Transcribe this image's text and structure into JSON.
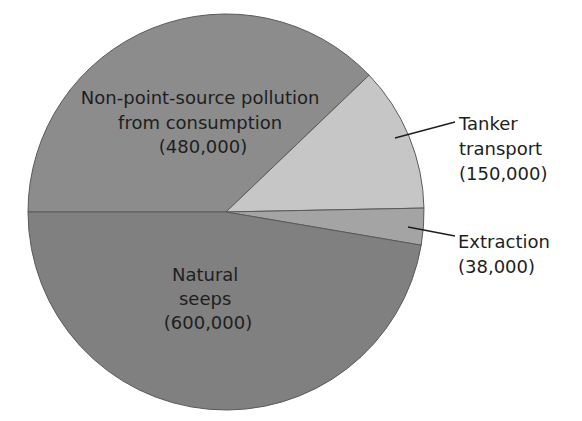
{
  "chart_data": {
    "type": "pie",
    "title": "",
    "unit_note": "",
    "slices": [
      {
        "name": "Non-point-source pollution from consumption",
        "label_lines": [
          "Non-point-source pollution",
          "from consumption",
          "(480,000)"
        ],
        "value": 480000,
        "color": "#8c8c8c"
      },
      {
        "name": "Tanker transport",
        "label_lines": [
          "Tanker",
          "transport",
          "(150,000)"
        ],
        "value": 150000,
        "color": "#c6c6c6"
      },
      {
        "name": "Extraction",
        "label_lines": [
          "Extraction",
          "(38,000)"
        ],
        "value": 38000,
        "color": "#a4a4a4"
      },
      {
        "name": "Natural seeps",
        "label_lines": [
          "Natural",
          "seeps",
          "(600,000)"
        ],
        "value": 600000,
        "color": "#808080"
      }
    ],
    "total": 1268000,
    "start_angle_deg": 180,
    "direction": "clockwise",
    "legend": "none (direct labels)"
  }
}
